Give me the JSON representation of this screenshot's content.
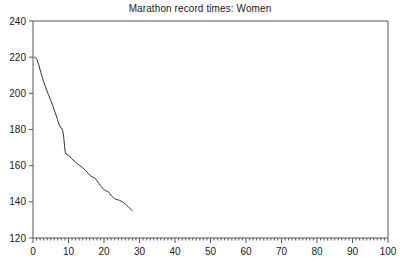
{
  "chart": {
    "title": "Marathon record times: Women",
    "xlabel": "",
    "ylabel": ""
  },
  "chart_data": {
    "type": "line",
    "title": "Marathon record times: Women",
    "xlabel": "",
    "ylabel": "",
    "xlim": [
      0,
      100
    ],
    "ylim": [
      120,
      240
    ],
    "xticks": [
      0,
      10,
      20,
      30,
      40,
      50,
      60,
      70,
      80,
      90,
      100
    ],
    "xtick_labels": [
      "0",
      "10",
      "20",
      "30",
      "40",
      "50",
      "60",
      "70",
      "80",
      "90",
      "100"
    ],
    "yticks": [
      120,
      140,
      160,
      180,
      200,
      220,
      240
    ],
    "ytick_labels": [
      "120",
      "140",
      "160",
      "180",
      "200",
      "220",
      "240"
    ],
    "x_minor_tick_interval": 1,
    "grid": false,
    "legend": null,
    "series": [
      {
        "name": "Marathon record times: Women",
        "color": "#333333",
        "line_width": 1,
        "marker": "none",
        "x": [
          0.4,
          1.0,
          1.6,
          2.2,
          2.9,
          3.6,
          4.3,
          5.0,
          5.7,
          6.3,
          6.9,
          7.4,
          7.8,
          8.1,
          8.4,
          8.7,
          8.9,
          9.1,
          9.4,
          10.0,
          10.8,
          11.6,
          12.4,
          13.2,
          14.0,
          14.8,
          15.6,
          16.3,
          16.9,
          17.3,
          17.8,
          18.4,
          19.0,
          19.6,
          20.2,
          20.7,
          21.1,
          21.6,
          22.2,
          22.8,
          23.3,
          23.8,
          24.4,
          25.2,
          26.0,
          26.8,
          27.4,
          27.9
        ],
        "y": [
          220.0,
          219.2,
          216.0,
          211.5,
          207.0,
          203.0,
          199.5,
          196.0,
          192.5,
          189.0,
          185.5,
          182.5,
          181.0,
          180.8,
          179.0,
          175.0,
          170.5,
          167.5,
          166.2,
          165.8,
          164.0,
          162.6,
          161.2,
          160.0,
          158.8,
          157.4,
          155.6,
          154.2,
          153.6,
          153.4,
          152.2,
          150.6,
          149.0,
          147.6,
          146.4,
          146.0,
          145.8,
          144.6,
          143.2,
          142.0,
          141.4,
          141.2,
          140.8,
          140.0,
          138.8,
          137.4,
          136.2,
          135.2
        ]
      }
    ]
  },
  "axis_style": {
    "frame_color": "#555555",
    "tick_color": "#555555",
    "background": "#ffffff"
  }
}
